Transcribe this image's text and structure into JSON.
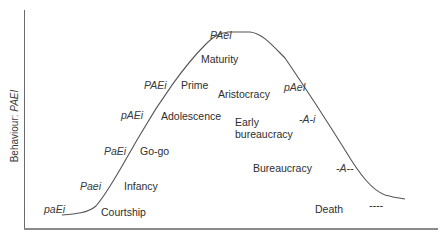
{
  "diagram": {
    "type": "lifecycle-curve",
    "y_axis_label": {
      "prefix": "Behaviour: ",
      "code": "PAEI"
    },
    "x_axis_label": "",
    "stages": [
      {
        "name": "Courtship",
        "code": "paEi",
        "phase": "growth"
      },
      {
        "name": "Infancy",
        "code": "Paei",
        "phase": "growth"
      },
      {
        "name": "Go-go",
        "code": "PaEi",
        "phase": "growth"
      },
      {
        "name": "Adolescence",
        "code": "pAEi",
        "phase": "growth"
      },
      {
        "name": "Prime",
        "code": "PAEi",
        "phase": "growth"
      },
      {
        "name": "Maturity",
        "code": "PAeI",
        "phase": "peak"
      },
      {
        "name": "Aristocracy",
        "code": "pAeI",
        "phase": "aging"
      },
      {
        "name": "Early bureaucracy",
        "code": "-A-i",
        "phase": "aging"
      },
      {
        "name": "Bureaucracy",
        "code": "-A--",
        "phase": "aging"
      },
      {
        "name": "Death",
        "code": "----",
        "phase": "aging"
      }
    ],
    "labels": {
      "courtship": "Courtship",
      "infancy": "Infancy",
      "gogo": "Go-go",
      "adolescence": "Adolescence",
      "prime": "Prime",
      "maturity": "Maturity",
      "aristocracy": "Aristocracy",
      "early_bureaucracy_1": "Early",
      "early_bureaucracy_2": "bureaucracy",
      "bureaucracy": "Bureaucracy",
      "death": "Death"
    },
    "codes": {
      "courtship": "paEi",
      "infancy": "Paei",
      "gogo": "PaEi",
      "adolescence": "pAEi",
      "prime": "PAEi",
      "maturity": "PAeI",
      "aristocracy": "pAeI",
      "early_bureaucracy": "-A-i",
      "bureaucracy": "-A--",
      "death": "----"
    },
    "colors": {
      "curve": "#555555",
      "axis": "#6a6a6a",
      "text": "#2e2e2e"
    }
  }
}
